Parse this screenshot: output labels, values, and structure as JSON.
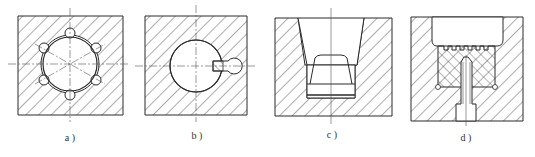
{
  "figure": {
    "panels": [
      {
        "id": "a",
        "caption": "a )",
        "description": "Square block section with central bore and six small circular holes equally spaced around it"
      },
      {
        "id": "b",
        "caption": "b )",
        "description": "Square block section with central round bore and a keyway/pin slot on the right"
      },
      {
        "id": "c",
        "caption": "c )",
        "description": "Block section with tapered stepped cavity and inserted plug"
      },
      {
        "id": "d",
        "caption": "d )",
        "description": "Block section with cavity, serrated insert, and fastening screw from below"
      }
    ]
  },
  "colors": {
    "line": "#2a2a2a",
    "hatch": "#4a4a4a",
    "background": "#ffffff"
  }
}
